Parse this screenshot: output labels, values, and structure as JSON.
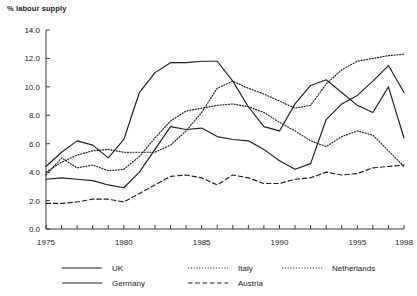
{
  "chart_data": {
    "type": "line",
    "title": "",
    "ylabel": "% labour supply",
    "xlabel": "",
    "ylim": [
      0.0,
      14.0
    ],
    "xlim": [
      1975,
      1998
    ],
    "yticks": [
      "0.0",
      "2.0",
      "4.0",
      "6.0",
      "8.0",
      "10.0",
      "12.0",
      "14.0"
    ],
    "ytick_values": [
      0.0,
      2.0,
      4.0,
      6.0,
      8.0,
      10.0,
      12.0,
      14.0
    ],
    "xticks": [
      "1975",
      "1980",
      "1985",
      "1990",
      "1995",
      "1998"
    ],
    "xtick_values": [
      1975,
      1980,
      1985,
      1990,
      1995,
      1998
    ],
    "xtick_minor_every": 1,
    "grid": false,
    "legend_position": "bottom",
    "x": [
      1975,
      1976,
      1977,
      1978,
      1979,
      1980,
      1981,
      1982,
      1983,
      1984,
      1985,
      1986,
      1987,
      1988,
      1989,
      1990,
      1991,
      1992,
      1993,
      1994,
      1995,
      1996,
      1997,
      1998
    ],
    "series": [
      {
        "name": "UK",
        "style": "solid",
        "values": [
          4.4,
          5.4,
          6.2,
          5.9,
          5.0,
          6.3,
          9.6,
          11.0,
          11.7,
          11.7,
          11.8,
          11.8,
          10.4,
          8.6,
          7.2,
          6.9,
          8.8,
          10.1,
          10.5,
          9.6,
          8.7,
          8.2,
          10.0,
          6.4
        ]
      },
      {
        "name": "Germany",
        "style": "solid",
        "values": [
          3.5,
          3.6,
          3.5,
          3.4,
          3.1,
          2.9,
          4.0,
          5.6,
          7.2,
          7.0,
          7.1,
          6.5,
          6.3,
          6.2,
          5.6,
          4.8,
          4.2,
          4.6,
          7.7,
          8.8,
          9.4,
          10.4,
          11.5,
          9.6
        ]
      },
      {
        "name": "Italy",
        "style": "dotted",
        "values": [
          4.0,
          4.7,
          5.2,
          5.5,
          5.6,
          5.4,
          5.4,
          5.4,
          5.9,
          6.9,
          8.2,
          9.9,
          10.4,
          9.9,
          9.5,
          9.0,
          8.5,
          8.7,
          10.2,
          11.2,
          11.8,
          12.0,
          12.2,
          12.3
        ]
      },
      {
        "name": "Netherlands",
        "style": "dotted",
        "values": [
          3.8,
          5.0,
          4.3,
          4.5,
          4.1,
          4.2,
          5.1,
          6.4,
          7.6,
          8.3,
          8.5,
          8.7,
          8.8,
          8.6,
          8.2,
          7.5,
          6.9,
          6.2,
          5.8,
          6.5,
          6.9,
          6.6,
          5.5,
          4.4
        ]
      },
      {
        "name": "Austria",
        "style": "dashed",
        "values": [
          1.8,
          1.8,
          1.9,
          2.1,
          2.1,
          1.9,
          2.5,
          3.1,
          3.7,
          3.8,
          3.6,
          3.1,
          3.8,
          3.6,
          3.2,
          3.2,
          3.5,
          3.6,
          4.0,
          3.8,
          3.9,
          4.3,
          4.4,
          4.5
        ]
      }
    ],
    "legend": [
      {
        "label": "UK",
        "style": "solid"
      },
      {
        "label": "Germany",
        "style": "solid"
      },
      {
        "label": "Italy",
        "style": "dotted"
      },
      {
        "label": "Austria",
        "style": "dashed"
      },
      {
        "label": "Netherlands",
        "style": "dotted"
      }
    ],
    "colors": {
      "line": "#1f1f1f",
      "axis": "#3a3a3a",
      "background": "#ffffff"
    }
  }
}
